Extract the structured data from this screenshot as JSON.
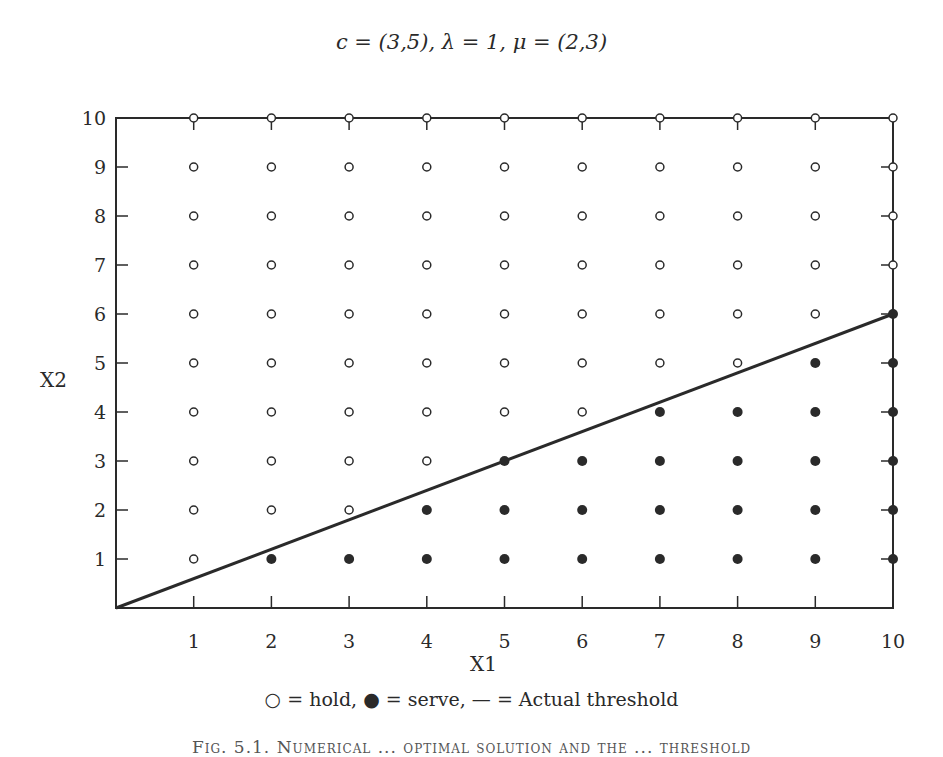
{
  "title": "c = (3,5), λ = 1, μ = (2,3)",
  "legend": "○ = hold, ● = serve, — = Actual threshold",
  "caption": "Fig. 5.1. Numerical ... optimal solution and the ... threshold",
  "chart_data": {
    "type": "scatter",
    "title": "c = (3,5), λ = 1, μ = (2,3)",
    "xlabel": "X1",
    "ylabel": "X2",
    "xlim": [
      0,
      10
    ],
    "ylim": [
      0,
      10
    ],
    "x_ticks": [
      1,
      2,
      3,
      4,
      5,
      6,
      7,
      8,
      9,
      10
    ],
    "y_ticks": [
      1,
      2,
      3,
      4,
      5,
      6,
      7,
      8,
      9,
      10
    ],
    "grid": false,
    "legend_position": "below",
    "legend_entries": [
      {
        "marker": "open-circle",
        "label": "hold"
      },
      {
        "marker": "filled-circle",
        "label": "serve"
      },
      {
        "marker": "line",
        "label": "Actual threshold"
      }
    ],
    "serve_min_x_by_row": {
      "1": 2,
      "2": 4,
      "3": 5,
      "4": 7,
      "5": 9,
      "6": 10,
      "7": null,
      "8": null,
      "9": null,
      "10": null
    },
    "series": [
      {
        "name": "hold",
        "marker": "open-circle",
        "points": [
          [
            1,
            1
          ],
          [
            1,
            2
          ],
          [
            2,
            2
          ],
          [
            3,
            2
          ],
          [
            1,
            3
          ],
          [
            2,
            3
          ],
          [
            3,
            3
          ],
          [
            4,
            3
          ],
          [
            1,
            4
          ],
          [
            2,
            4
          ],
          [
            3,
            4
          ],
          [
            4,
            4
          ],
          [
            5,
            4
          ],
          [
            6,
            4
          ],
          [
            1,
            5
          ],
          [
            2,
            5
          ],
          [
            3,
            5
          ],
          [
            4,
            5
          ],
          [
            5,
            5
          ],
          [
            6,
            5
          ],
          [
            7,
            5
          ],
          [
            8,
            5
          ],
          [
            1,
            6
          ],
          [
            2,
            6
          ],
          [
            3,
            6
          ],
          [
            4,
            6
          ],
          [
            5,
            6
          ],
          [
            6,
            6
          ],
          [
            7,
            6
          ],
          [
            8,
            6
          ],
          [
            9,
            6
          ],
          [
            1,
            7
          ],
          [
            2,
            7
          ],
          [
            3,
            7
          ],
          [
            4,
            7
          ],
          [
            5,
            7
          ],
          [
            6,
            7
          ],
          [
            7,
            7
          ],
          [
            8,
            7
          ],
          [
            9,
            7
          ],
          [
            10,
            7
          ],
          [
            1,
            8
          ],
          [
            2,
            8
          ],
          [
            3,
            8
          ],
          [
            4,
            8
          ],
          [
            5,
            8
          ],
          [
            6,
            8
          ],
          [
            7,
            8
          ],
          [
            8,
            8
          ],
          [
            9,
            8
          ],
          [
            10,
            8
          ],
          [
            1,
            9
          ],
          [
            2,
            9
          ],
          [
            3,
            9
          ],
          [
            4,
            9
          ],
          [
            5,
            9
          ],
          [
            6,
            9
          ],
          [
            7,
            9
          ],
          [
            8,
            9
          ],
          [
            9,
            9
          ],
          [
            10,
            9
          ],
          [
            1,
            10
          ],
          [
            2,
            10
          ],
          [
            3,
            10
          ],
          [
            4,
            10
          ],
          [
            5,
            10
          ],
          [
            6,
            10
          ],
          [
            7,
            10
          ],
          [
            8,
            10
          ],
          [
            9,
            10
          ],
          [
            10,
            10
          ]
        ]
      },
      {
        "name": "serve",
        "marker": "filled-circle",
        "points": [
          [
            2,
            1
          ],
          [
            3,
            1
          ],
          [
            4,
            1
          ],
          [
            5,
            1
          ],
          [
            6,
            1
          ],
          [
            7,
            1
          ],
          [
            8,
            1
          ],
          [
            9,
            1
          ],
          [
            10,
            1
          ],
          [
            4,
            2
          ],
          [
            5,
            2
          ],
          [
            6,
            2
          ],
          [
            7,
            2
          ],
          [
            8,
            2
          ],
          [
            9,
            2
          ],
          [
            10,
            2
          ],
          [
            5,
            3
          ],
          [
            6,
            3
          ],
          [
            7,
            3
          ],
          [
            8,
            3
          ],
          [
            9,
            3
          ],
          [
            10,
            3
          ],
          [
            7,
            4
          ],
          [
            8,
            4
          ],
          [
            9,
            4
          ],
          [
            10,
            4
          ],
          [
            9,
            5
          ],
          [
            10,
            5
          ],
          [
            10,
            6
          ]
        ]
      },
      {
        "name": "Actual threshold",
        "type": "line",
        "x": [
          0,
          10
        ],
        "y": [
          0,
          6
        ]
      }
    ]
  }
}
